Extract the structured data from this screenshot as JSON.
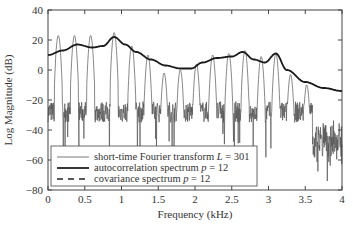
{
  "chart_data": {
    "type": "line",
    "title": "",
    "xlabel": "Frequency (kHz)",
    "ylabel": "Log Magnitude (dB)",
    "xlim": [
      0,
      4
    ],
    "ylim": [
      -80,
      40
    ],
    "xticks": [
      "0",
      "0.5",
      "1",
      "1.5",
      "2",
      "2.5",
      "3",
      "3.5",
      "4"
    ],
    "yticks": [
      "40",
      "20",
      "0",
      "-20",
      "-40",
      "-60",
      "-80"
    ],
    "grid": false,
    "legend_position": "lower left",
    "series": [
      {
        "name": "short-time Fourier transform L = 301",
        "style": "thin solid",
        "harmonic_peaks": {
          "x": [
            0.14,
            0.36,
            0.58,
            0.9,
            1.14,
            1.36,
            1.58,
            1.8,
            2.02,
            2.24,
            2.46,
            2.68,
            2.9,
            3.1,
            3.3,
            3.52
          ],
          "y": [
            23,
            23,
            23,
            25,
            16,
            10,
            -2,
            0,
            4,
            10,
            11,
            13,
            9,
            11,
            -3,
            -10
          ]
        }
      },
      {
        "name": "autocorrelation spectrum p = 12",
        "style": "thick solid",
        "x": [
          0,
          0.2,
          0.4,
          0.6,
          0.75,
          0.9,
          1.05,
          1.2,
          1.4,
          1.6,
          1.8,
          1.95,
          2.1,
          2.3,
          2.5,
          2.65,
          2.8,
          2.95,
          3.1,
          3.25,
          3.5,
          3.75,
          4.0
        ],
        "y": [
          10,
          13,
          17,
          15,
          16,
          22,
          17,
          12,
          7,
          3,
          1,
          1,
          5,
          8,
          9,
          12,
          7,
          5,
          11,
          0,
          -8,
          -12,
          -14
        ]
      },
      {
        "name": "covariance spectrum p = 12",
        "style": "dashed",
        "x": [
          0,
          0.4,
          0.9,
          1.6,
          1.95,
          2.65,
          3.1,
          3.5,
          4.0
        ],
        "y": [
          10,
          17,
          22,
          3,
          1,
          12,
          11,
          -8,
          -14
        ]
      }
    ]
  },
  "legend": {
    "items": [
      {
        "label": "short-time Fourier transform L = 301",
        "prefix": "short-time Fourier transform ",
        "var": "L",
        "suffix": " = 301"
      },
      {
        "label": "autocorrelation spectrum p = 12",
        "prefix": "autocorrelation spectrum ",
        "var": "p",
        "suffix": " = 12"
      },
      {
        "label": "covariance spectrum p = 12",
        "prefix": "covariance spectrum ",
        "var": "p",
        "suffix": " = 12"
      }
    ]
  },
  "axes": {
    "xlabel": "Frequency (kHz)",
    "ylabel": "Log Magnitude (dB)",
    "xticks": [
      "0",
      "0.5",
      "1",
      "1.5",
      "2",
      "2.5",
      "3",
      "3.5",
      "4"
    ],
    "yticks": [
      "40",
      "20",
      "0",
      "−20",
      "−40",
      "−60",
      "−80"
    ]
  }
}
